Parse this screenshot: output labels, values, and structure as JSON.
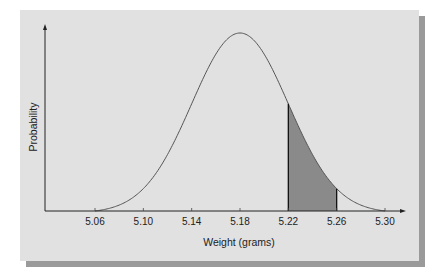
{
  "chart_data": {
    "type": "area",
    "title": "",
    "xlabel": "Weight (grams)",
    "ylabel": "Probability",
    "distribution": "normal",
    "mean": 5.18,
    "std_dev": 0.04,
    "x_ticks": [
      "5.06",
      "5.10",
      "5.14",
      "5.18",
      "5.22",
      "5.26",
      "5.30"
    ],
    "xlim": [
      5.06,
      5.3
    ],
    "shaded_region": {
      "from": 5.22,
      "to": 5.26
    },
    "grid": false,
    "legend": null
  },
  "colors": {
    "panel": "#e1e1e1",
    "shadow": "#9a9a9a",
    "curve": "#555555",
    "shade": "#8a8a8a",
    "axis": "#222222"
  }
}
